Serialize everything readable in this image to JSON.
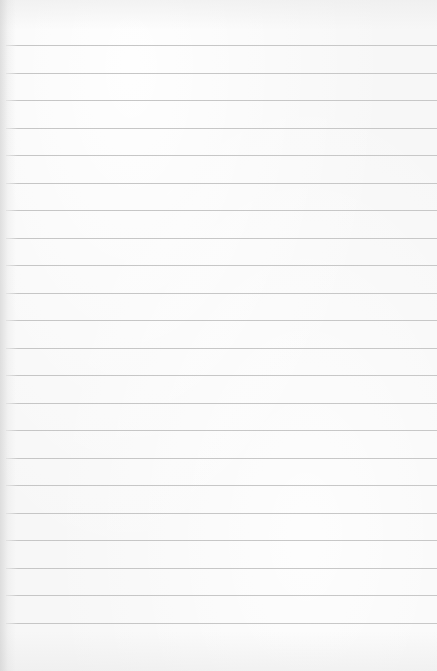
{
  "paper": {
    "kind": "blank lined paper",
    "background_color": "#f7f7f7",
    "rule_color": "#c8c8c8",
    "rule_count": 22,
    "first_rule_y": 45,
    "rule_spacing": 27.5
  }
}
